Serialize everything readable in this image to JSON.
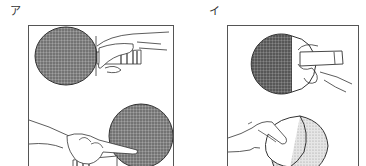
{
  "figure": {
    "panels": [
      {
        "label": "ア",
        "description": "shakehand grip",
        "illustrations": [
          "forehand-side grip, hand on handle",
          "backhand-side grip, index finger on rubber"
        ]
      },
      {
        "label": "イ",
        "description": "penholder grip",
        "illustrations": [
          "penholder front, dark rubber",
          "penholder back, fingers on light rubber"
        ]
      }
    ],
    "colors": {
      "line": "#333333",
      "dark_rubber": "#6e6e6e",
      "light_rubber": "#c9c9c9",
      "frame": "#555555"
    }
  }
}
